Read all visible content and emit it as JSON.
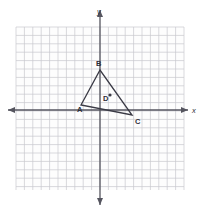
{
  "figure": {
    "background_color": "#ffffff",
    "grid_color": "#c9c9cf",
    "axis_color": "#55555f",
    "shape_color": "#3a3a45",
    "label_color": "#2e2e38"
  },
  "axes": {
    "x_label": "x",
    "y_label": "y",
    "x_label_pos": {
      "px": 192,
      "py": 113
    },
    "y_label_pos": {
      "px": 97,
      "py": 14
    },
    "x_axis_py": 110,
    "y_axis_px": 100,
    "x_axis_start_px": 8,
    "x_axis_end_px": 188,
    "y_axis_start_py": 10,
    "y_axis_end_py": 205,
    "arrowheads": [
      "left",
      "right",
      "up",
      "down"
    ]
  },
  "grid": {
    "left_px": 16,
    "top_py": 27,
    "right_px": 184,
    "bottom_py": 190,
    "cell_px": 8.4,
    "cols": 20,
    "rows": 19,
    "show_minor": true
  },
  "chart_data": {
    "type": "scatter",
    "xlabel": "x",
    "ylabel": "y",
    "grid": true,
    "legend": "none",
    "xlim": [
      -10,
      10
    ],
    "ylim": [
      -9.5,
      9.9
    ],
    "unit_px": 8.4,
    "origin_px": {
      "px": 100,
      "py": 110
    },
    "points": [
      {
        "label": "A",
        "x": -2.25,
        "y": 0.6,
        "px": 81,
        "py": 105,
        "label_px": 77,
        "label_py": 112,
        "dot": false
      },
      {
        "label": "B",
        "x": 0.0,
        "y": 4.75,
        "px": 100,
        "py": 70,
        "label_px": 96,
        "label_py": 66,
        "dot": false
      },
      {
        "label": "C",
        "x": 3.8,
        "y": -0.6,
        "px": 132,
        "py": 115,
        "label_px": 135,
        "label_py": 124,
        "dot": false
      },
      {
        "label": "D",
        "x": 1.2,
        "y": 1.8,
        "px": 110,
        "py": 95,
        "label_px": 103,
        "label_py": 101,
        "dot": true
      }
    ],
    "polygon": {
      "name": "triangle-abc",
      "vertices": [
        "A",
        "B",
        "C"
      ],
      "closed": true,
      "fill": "none"
    }
  }
}
